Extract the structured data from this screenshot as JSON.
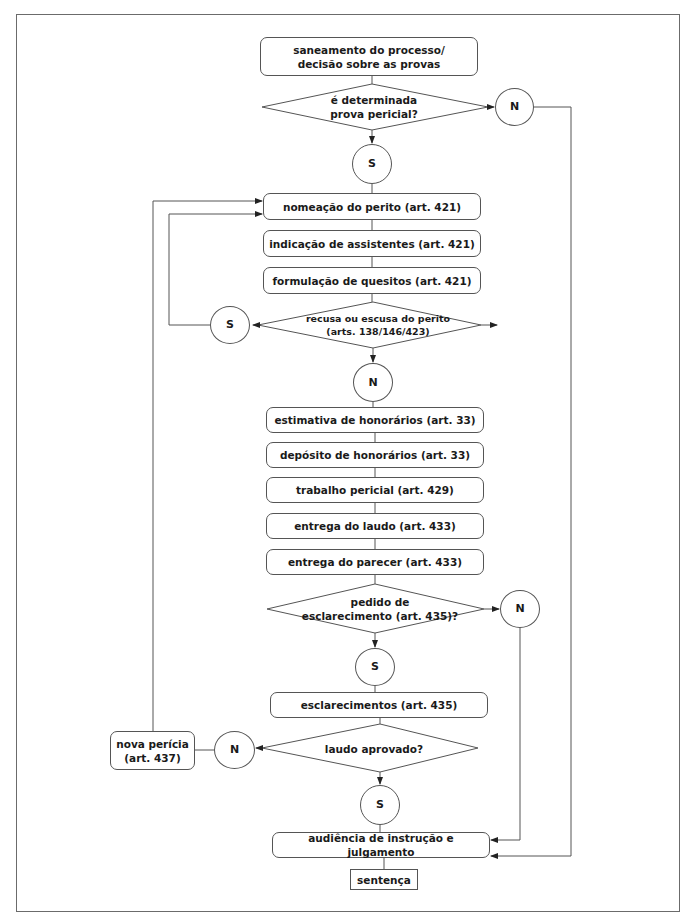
{
  "diagram": {
    "type": "flowchart",
    "nodes": {
      "saneamento": "saneamento do processo/\ndecisão sobre as provas",
      "decision_prova": "é determinada\nprova pericial?",
      "c1_n": "N",
      "c1_s": "S",
      "nomeacao": "nomeação do perito (art. 421)",
      "indicacao": "indicação de assistentes (art. 421)",
      "formulacao": "formulação de quesitos (art. 421)",
      "decision_recusa": "recusa ou escusa do perito\n(arts. 138/146/423)",
      "c2_s": "S",
      "c2_n": "N",
      "estimativa": "estimativa de honorários (art. 33)",
      "deposito": "depósito de honorários (art. 33)",
      "trabalho": "trabalho pericial (art. 429)",
      "entrega_laudo": "entrega do laudo (art. 433)",
      "entrega_parecer": "entrega do parecer (art. 433)",
      "decision_esclarecimento": "pedido de\nesclarecimento (art. 435)?",
      "c3_n": "N",
      "c3_s": "S",
      "esclarecimentos": "esclarecimentos (art. 435)",
      "decision_laudo": "laudo aprovado?",
      "c4_n": "N",
      "c4_s": "S",
      "nova_pericia": "nova perícia\n(art. 437)",
      "audiencia": "audiência de instrução e julgamento",
      "sentenca": "sentença"
    },
    "edges": [
      [
        "saneamento",
        "decision_prova"
      ],
      [
        "decision_prova",
        "c1_n",
        "N"
      ],
      [
        "decision_prova",
        "c1_s",
        "S"
      ],
      [
        "c1_n",
        "audiencia"
      ],
      [
        "c1_s",
        "nomeacao"
      ],
      [
        "nomeacao",
        "indicacao"
      ],
      [
        "indicacao",
        "formulacao"
      ],
      [
        "formulacao",
        "decision_recusa"
      ],
      [
        "decision_recusa",
        "c2_s",
        "S"
      ],
      [
        "c2_s",
        "nomeacao"
      ],
      [
        "decision_recusa",
        "c2_n",
        "N"
      ],
      [
        "c2_n",
        "estimativa"
      ],
      [
        "estimativa",
        "deposito"
      ],
      [
        "deposito",
        "trabalho"
      ],
      [
        "trabalho",
        "entrega_laudo"
      ],
      [
        "entrega_laudo",
        "entrega_parecer"
      ],
      [
        "entrega_parecer",
        "decision_esclarecimento"
      ],
      [
        "decision_esclarecimento",
        "c3_n",
        "N"
      ],
      [
        "decision_esclarecimento",
        "c3_s",
        "S"
      ],
      [
        "c3_n",
        "audiencia"
      ],
      [
        "c3_s",
        "esclarecimentos"
      ],
      [
        "esclarecimentos",
        "decision_laudo"
      ],
      [
        "decision_laudo",
        "c4_n",
        "N"
      ],
      [
        "decision_laudo",
        "c4_s",
        "S"
      ],
      [
        "c4_n",
        "nova_pericia"
      ],
      [
        "nova_pericia",
        "nomeacao"
      ],
      [
        "c4_s",
        "audiencia"
      ],
      [
        "audiencia",
        "sentenca"
      ]
    ]
  },
  "colors": {
    "line": "#555555",
    "frame": "#6b6b6b",
    "text": "#1a1a1a",
    "background": "#ffffff"
  }
}
